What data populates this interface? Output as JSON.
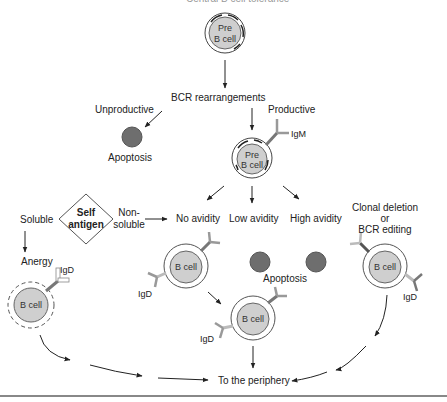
{
  "title": "Central B cell tolerance",
  "colors": {
    "cell_fill": "#cfcfcf",
    "apoptotic_fill": "#6e6e6e",
    "line": "#222222",
    "receptor": "#8a8a8a"
  },
  "nodes": {
    "pre_b_cell_top": {
      "line1": "Pre",
      "line2": "B cell"
    },
    "bcr_rearrangements": "BCR rearrangements",
    "unproductive": "Unproductive",
    "productive": "Productive",
    "apoptosis_top": "Apoptosis",
    "pre_b_cell_igm": {
      "line1": "Pre",
      "line2": "B cell",
      "receptor": "IgM"
    },
    "self_antigen": {
      "line1": "Self",
      "line2": "antigen"
    },
    "soluble": "Soluble",
    "non_soluble": {
      "line1": "Non-",
      "line2": "soluble"
    },
    "anergy": "Anergy",
    "anergic_cell": {
      "label": "B cell",
      "receptor": "IgD"
    },
    "no_avidity": "No avidity",
    "low_avidity": "Low avidity",
    "high_avidity": "High avidity",
    "no_avidity_cell": {
      "label": "B cell",
      "receptor": "IgD"
    },
    "apoptosis_mid": "Apoptosis",
    "clonal_deletion": {
      "line1": "Clonal deletion",
      "line2": "or",
      "line3": "BCR editing"
    },
    "edited_cell": {
      "label": "B cell",
      "receptor": "IgD"
    },
    "mature_cell": {
      "label": "B cell",
      "receptor": "IgD"
    },
    "periphery": "To the periphery"
  }
}
